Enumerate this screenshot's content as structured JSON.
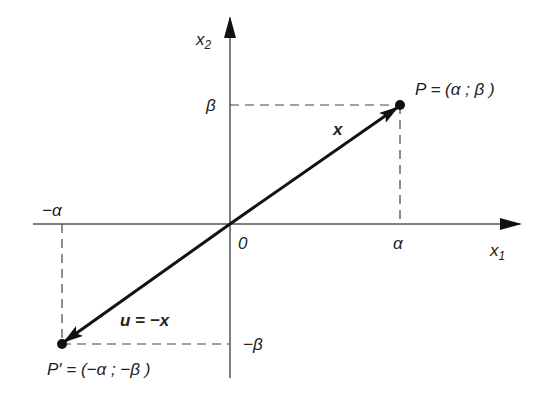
{
  "diagram": {
    "axes": {
      "x_label": "x",
      "x_sub": "1",
      "y_label": "x",
      "y_sub": "2",
      "origin_label": "0"
    },
    "ticks": {
      "alpha": "α",
      "neg_alpha": "−α",
      "beta": "β",
      "neg_beta": "−β"
    },
    "points": {
      "P": "P = (α ; β )",
      "P_prime": "P′ = (−α ; −β )"
    },
    "vectors": {
      "x": "x",
      "u": "u = −x"
    },
    "colors": {
      "axis": "#555555",
      "vector": "#111111",
      "dashed": "#444444"
    }
  }
}
